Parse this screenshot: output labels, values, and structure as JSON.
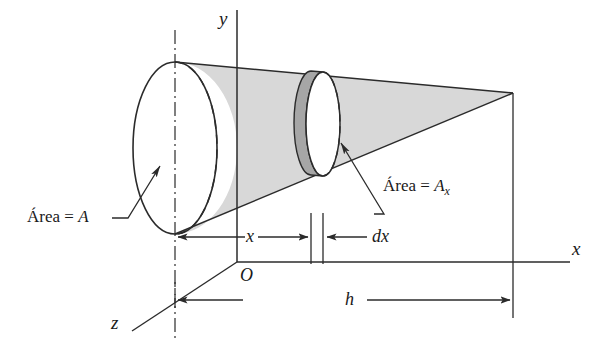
{
  "figure": {
    "axes": {
      "x_label": "x",
      "y_label": "y",
      "z_label": "z",
      "origin_label": "O"
    },
    "dimensions": [
      {
        "id": "x",
        "label": "x"
      },
      {
        "id": "dx",
        "label": "dx"
      },
      {
        "id": "h",
        "label": "h"
      }
    ],
    "annotations": [
      {
        "id": "base-area",
        "text": "Área = A",
        "prefix": "Área = ",
        "var": "A",
        "sub": ""
      },
      {
        "id": "slice-area",
        "text": "Área = Ax",
        "prefix": "Área = ",
        "var": "A",
        "sub": "x"
      }
    ],
    "colors": {
      "line": "#2b2b2b",
      "cone_fill": "#d8d8d8",
      "disc_band_fill": "#a6a6a6",
      "background": "#ffffff"
    }
  }
}
